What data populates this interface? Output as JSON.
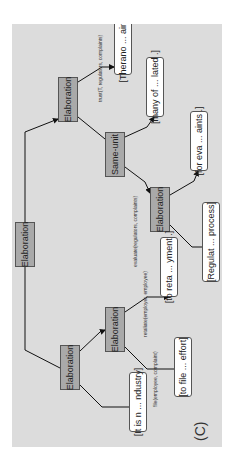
{
  "diagram": {
    "panel_label": "(C)",
    "nodes": {
      "root": "Elaboration",
      "left": "Elaboration",
      "left_child": "Elaboration",
      "right": "Elaboration",
      "same_unit": "Same-unit",
      "same_unit_child": "Elaboration"
    },
    "leaves": {
      "l1": "[It is n ... ndustry]",
      "l2": "[to file ... effort]",
      "l3": "[to reta ... yment .]",
      "l4": "[Regulat ... process]",
      "l5": "[for eva ... aints .]",
      "l6": "[many of ... lated .]",
      "l7": "[Therano ... aints .]"
    },
    "edge_labels": {
      "file": "file(employee, complaint)",
      "retaliate": "retaliate(employer, employee)",
      "evaluate": "evaluate(regulators, complaints)",
      "trust": "trust(T, regulators, complaints)"
    },
    "colors": {
      "background": "#dcdcdc",
      "relation_node": "#a9a9a9",
      "leaf_node": "#ffffff",
      "edge": "#111111"
    }
  }
}
